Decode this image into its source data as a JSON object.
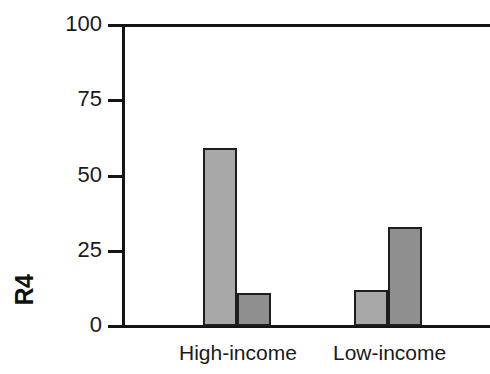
{
  "chart_data": {
    "type": "bar",
    "title": "",
    "xlabel": "",
    "ylabel": "R4",
    "ylim": [
      0,
      100
    ],
    "yticks": [
      0,
      25,
      50,
      75,
      100
    ],
    "ytick_labels": [
      "0",
      "25",
      "50",
      "75",
      "100"
    ],
    "grid": false,
    "legend": "none",
    "categories": [
      "High-income",
      "Low-income"
    ],
    "series": [
      {
        "name": "series-1",
        "color": "#a8a8a8",
        "values": [
          59,
          12
        ]
      },
      {
        "name": "series-2",
        "color": "#8f8f8f",
        "values": [
          11,
          33
        ]
      }
    ],
    "bars": [
      {
        "category": "High-income",
        "series": "series-1",
        "value": 59,
        "color": "#a8a8a8"
      },
      {
        "category": "High-income",
        "series": "series-2",
        "value": 11,
        "color": "#8f8f8f"
      },
      {
        "category": "Low-income",
        "series": "series-1",
        "value": 12,
        "color": "#a8a8a8"
      },
      {
        "category": "Low-income",
        "series": "series-2",
        "value": 33,
        "color": "#8f8f8f"
      }
    ]
  },
  "axis": {
    "y_title": "R4",
    "ticks": [
      {
        "label": "100",
        "value": 100
      },
      {
        "label": "75",
        "value": 75
      },
      {
        "label": "50",
        "value": 50
      },
      {
        "label": "25",
        "value": 25
      },
      {
        "label": "0",
        "value": 0
      }
    ]
  },
  "categories": [
    {
      "label": "High-income"
    },
    {
      "label": "Low-income"
    }
  ],
  "style": {
    "bar_light": "#a8a8a8",
    "bar_dark": "#8f8f8f",
    "line_color": "#151515",
    "background": "#ffffff"
  }
}
